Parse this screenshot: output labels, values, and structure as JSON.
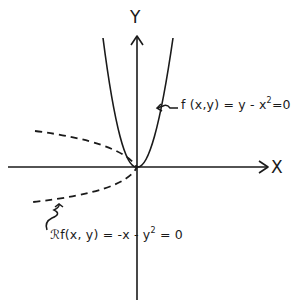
{
  "diagram": {
    "axes": {
      "x_label": "X",
      "y_label": "Y"
    },
    "curves": [
      {
        "id": "parabola",
        "style": "solid",
        "equation_prefix": "f (x,y) = y - x",
        "equation_exponent": "2",
        "equation_suffix": "=0"
      },
      {
        "id": "reflected",
        "style": "dashed",
        "equation_prefix": "ℛf(x, y) = -x - y",
        "equation_exponent": "2",
        "equation_suffix": " = 0"
      }
    ],
    "colors": {
      "ink": "#1a1a1a",
      "background": "#ffffff"
    }
  }
}
